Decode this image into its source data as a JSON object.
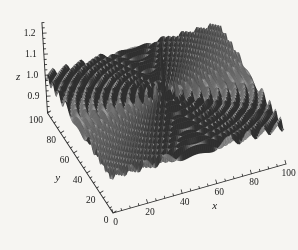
{
  "figure": {
    "kind": "3d-surface-plot",
    "background": "#f6f5f2"
  },
  "chart_data": {
    "type": "surface",
    "title": "",
    "xlabel": "x",
    "ylabel": "y",
    "zlabel": "z",
    "x_range": [
      0,
      100
    ],
    "y_range": [
      0,
      100
    ],
    "z_range": [
      0.82,
      1.3
    ],
    "x_ticks": {
      "values": [
        0,
        20,
        40,
        60,
        80,
        100
      ],
      "labels": [
        "0",
        "20",
        "40",
        "60",
        "80",
        "100"
      ],
      "minor_step": 5
    },
    "y_ticks": {
      "values": [
        0,
        20,
        40,
        60,
        80,
        100
      ],
      "labels": [
        "0",
        "20",
        "40",
        "60",
        "80",
        "100"
      ],
      "minor_step": 5
    },
    "z_ticks": {
      "values": [
        0.9,
        1.0,
        1.1,
        1.2
      ],
      "labels": [
        "0.9",
        "1.0",
        "1.1",
        "1.2"
      ],
      "minor_step": 0.025,
      "minor_min": 0.825,
      "minor_max": 1.25
    },
    "surface": {
      "description": "Radially symmetric damped ripple centered at (50,50) with a tall narrow central spike",
      "center": [
        50,
        50
      ],
      "formula": "z(x,y) = 1 + 0.3*cos(1.3*r)/(1 + sqrt(2.2*r)), r = distance to center",
      "base_z": 1.0,
      "peak_z": 1.3,
      "amplitude": 0.3,
      "wave_number": 1.3,
      "decay": 2.2,
      "grid_cells": 90
    },
    "style": {
      "surface_gray_light": "#a2a2a2",
      "surface_gray_dark": "#343434",
      "mesh_line": "rgba(35,35,35,0.45)",
      "axis_color": "#2a2a2a",
      "label_color": "#1a1a1a",
      "background": "#f6f5f2"
    },
    "legend": null,
    "grid": false
  }
}
